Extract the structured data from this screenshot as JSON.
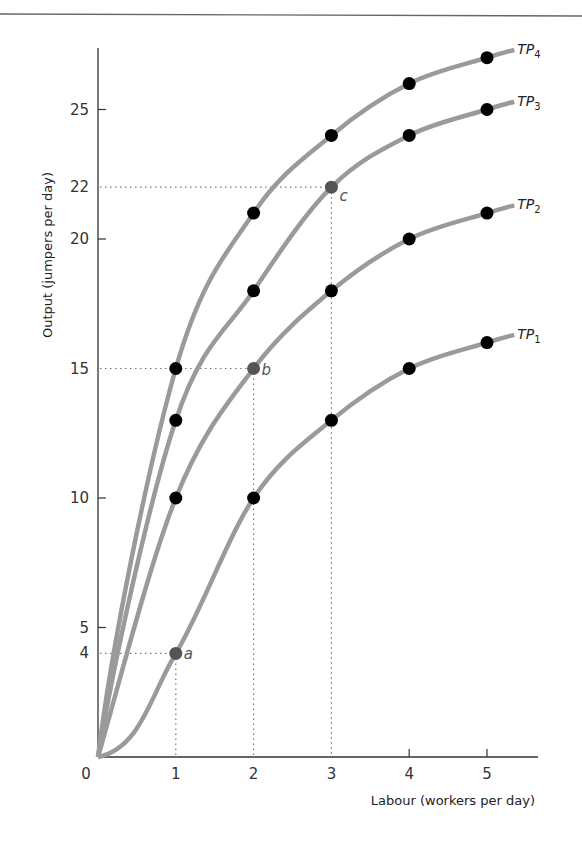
{
  "header": {
    "rule": true
  },
  "chart_data": {
    "type": "line",
    "title": "",
    "xlabel": "Labour (workers per day)",
    "ylabel": "Output (jumpers per day)",
    "x_ticks": [
      0,
      1,
      2,
      3,
      4,
      5
    ],
    "y_ticks": [
      0,
      4,
      5,
      10,
      15,
      20,
      22,
      25
    ],
    "xlim": [
      0,
      5.6
    ],
    "ylim": [
      0,
      27.5
    ],
    "grid": false,
    "legend": "labels at curve ends",
    "x": [
      0,
      1,
      2,
      3,
      4,
      5
    ],
    "series": [
      {
        "name": "TP",
        "sub": "1",
        "values": [
          0,
          4,
          10,
          13,
          15,
          16
        ]
      },
      {
        "name": "TP",
        "sub": "2",
        "values": [
          0,
          10,
          15,
          18,
          20,
          21
        ]
      },
      {
        "name": "TP",
        "sub": "3",
        "values": [
          0,
          13,
          18,
          22,
          24,
          25
        ]
      },
      {
        "name": "TP",
        "sub": "4",
        "values": [
          0,
          15,
          21,
          24,
          26,
          27
        ]
      }
    ],
    "highlighted_points": [
      {
        "label": "a",
        "x": 1,
        "y": 4,
        "series": "TP1"
      },
      {
        "label": "b",
        "x": 2,
        "y": 15,
        "series": "TP2"
      },
      {
        "label": "c",
        "x": 3,
        "y": 22,
        "series": "TP3"
      }
    ],
    "annotations": [
      "Dotted guide lines from y=4 to point a and down to x=1",
      "Dotted guide lines from y=15 to point b and down to x=2",
      "Dotted guide lines from y=22 to point c and down to x=3"
    ]
  },
  "colors": {
    "curve": "#9a9a9a",
    "point": "#000000",
    "highlight_point": "#555555",
    "axis": "#333333",
    "guide": "#777777"
  }
}
